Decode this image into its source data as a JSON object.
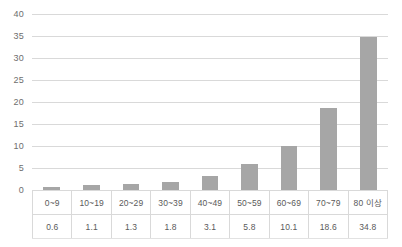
{
  "chart_data": {
    "type": "bar",
    "title": "",
    "subtitle": "",
    "xlabel": "",
    "ylabel": "",
    "categories": [
      "0~9",
      "10~19",
      "20~29",
      "30~39",
      "40~49",
      "50~59",
      "60~69",
      "70~79",
      "80 이상"
    ],
    "values": [
      0.6,
      1.1,
      1.3,
      1.8,
      3.1,
      5.8,
      10.1,
      18.6,
      34.8
    ],
    "value_labels": [
      "0.6",
      "1.1",
      "1.3",
      "1.8",
      "3.1",
      "5.8",
      "10.1",
      "18.6",
      "34.8"
    ],
    "ylim": [
      0,
      40
    ],
    "y_ticks": [
      0,
      5,
      10,
      15,
      20,
      25,
      30,
      35,
      40
    ],
    "y_tick_labels": [
      "0",
      "5",
      "10",
      "15",
      "20",
      "25",
      "30",
      "35",
      "40"
    ],
    "grid": true,
    "legend": false,
    "legend_position": "none",
    "series": [
      {
        "name": "",
        "values": [
          0.6,
          1.1,
          1.3,
          1.8,
          3.1,
          5.8,
          10.1,
          18.6,
          34.8
        ]
      }
    ],
    "data_table_visible": true,
    "colors": {
      "bar": "#a6a6a6",
      "gridline": "#d9d9d9",
      "table_border": "#d9d9d9",
      "text": "#595959",
      "background": "#ffffff"
    }
  }
}
